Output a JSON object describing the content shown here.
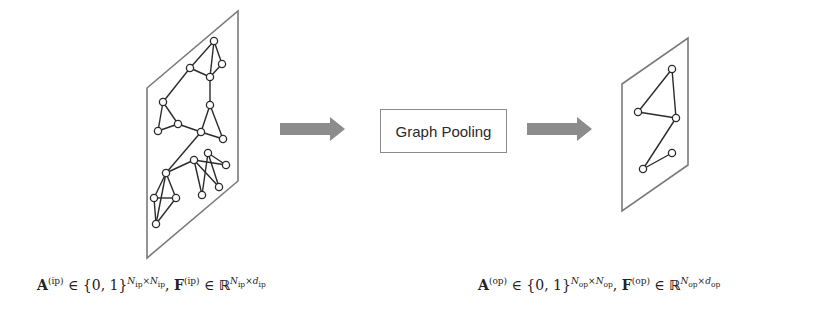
{
  "diagram": {
    "operation_label": "Graph Pooling",
    "colors": {
      "plane_stroke": "#7a7a7a",
      "edge_stroke": "#2b2b2b",
      "node_fill": "#ffffff",
      "node_stroke": "#2b2b2b",
      "arrow_fill": "#8c8c8c",
      "box_stroke": "#8a8a8a"
    },
    "input_graph": {
      "plane": [
        [
          147,
          88
        ],
        [
          238,
          11
        ],
        [
          238,
          181
        ],
        [
          147,
          258
        ]
      ],
      "nodes": [
        [
          214,
          41
        ],
        [
          222,
          64
        ],
        [
          190,
          68
        ],
        [
          210,
          77
        ],
        [
          163,
          102
        ],
        [
          158,
          131
        ],
        [
          178,
          124
        ],
        [
          210,
          105
        ],
        [
          201,
          132
        ],
        [
          223,
          139
        ],
        [
          166,
          173
        ],
        [
          154,
          198
        ],
        [
          176,
          198
        ],
        [
          156,
          224
        ],
        [
          194,
          160
        ],
        [
          208,
          153
        ],
        [
          226,
          165
        ],
        [
          219,
          187
        ],
        [
          202,
          195
        ]
      ],
      "edges": [
        [
          0,
          1
        ],
        [
          0,
          2
        ],
        [
          0,
          3
        ],
        [
          1,
          3
        ],
        [
          2,
          3
        ],
        [
          2,
          4
        ],
        [
          3,
          7
        ],
        [
          4,
          5
        ],
        [
          4,
          6
        ],
        [
          5,
          6
        ],
        [
          6,
          8
        ],
        [
          7,
          8
        ],
        [
          7,
          9
        ],
        [
          8,
          9
        ],
        [
          8,
          10
        ],
        [
          10,
          11
        ],
        [
          10,
          12
        ],
        [
          10,
          13
        ],
        [
          11,
          12
        ],
        [
          11,
          13
        ],
        [
          12,
          13
        ],
        [
          10,
          14
        ],
        [
          14,
          16
        ],
        [
          14,
          17
        ],
        [
          14,
          18
        ],
        [
          15,
          16
        ],
        [
          15,
          18
        ],
        [
          15,
          17
        ]
      ]
    },
    "output_graph": {
      "plane": [
        [
          622,
          84
        ],
        [
          688,
          38
        ],
        [
          688,
          165
        ],
        [
          622,
          211
        ]
      ],
      "nodes": [
        [
          672,
          69
        ],
        [
          638,
          112
        ],
        [
          676,
          118
        ],
        [
          672,
          153
        ],
        [
          643,
          169
        ]
      ],
      "edges": [
        [
          0,
          1
        ],
        [
          0,
          2
        ],
        [
          1,
          2
        ],
        [
          2,
          4
        ],
        [
          3,
          4
        ]
      ]
    },
    "arrows": [
      {
        "x1": 280,
        "x2": 345,
        "y": 129
      },
      {
        "x1": 527,
        "x2": 592,
        "y": 129
      }
    ],
    "formulas": {
      "left": {
        "A": "A",
        "A_sup": "(ip)",
        "in1": "∈",
        "set": "{0, 1}",
        "set_sup_N1": "N",
        "set_sup_N1_sub": "ip",
        "times": "×",
        "set_sup_N2": "N",
        "set_sup_N2_sub": "ip",
        "comma": ",",
        "F": "F",
        "F_sup": "(ip)",
        "in2": "∈",
        "R": "ℝ",
        "R_sup_N": "N",
        "R_sup_N_sub": "ip",
        "R_sup_d": "d",
        "R_sup_d_sub": "ip"
      },
      "right": {
        "A": "A",
        "A_sup": "(op)",
        "in1": "∈",
        "set": "{0, 1}",
        "set_sup_N1": "N",
        "set_sup_N1_sub": "op",
        "times": "×",
        "set_sup_N2": "N",
        "set_sup_N2_sub": "op",
        "comma": ",",
        "F": "F",
        "F_sup": "(op)",
        "in2": "∈",
        "R": "ℝ",
        "R_sup_N": "N",
        "R_sup_N_sub": "op",
        "R_sup_d": "d",
        "R_sup_d_sub": "op"
      }
    }
  }
}
